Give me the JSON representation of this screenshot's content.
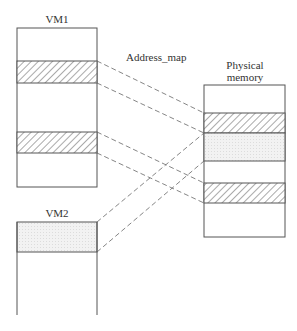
{
  "labels": {
    "vm1": "VM1",
    "vm2": "VM2",
    "address_map": "Address_map",
    "physical_line1": "Physical",
    "physical_line2": "memory"
  },
  "legend_semantics": {
    "hatched": "VM1 mapped pages",
    "dotted": "VM2 mapped page"
  },
  "colors": {
    "stroke": "#555555",
    "dashed": "#666666",
    "dotted_fill": "#ececec",
    "background": "#ffffff"
  }
}
